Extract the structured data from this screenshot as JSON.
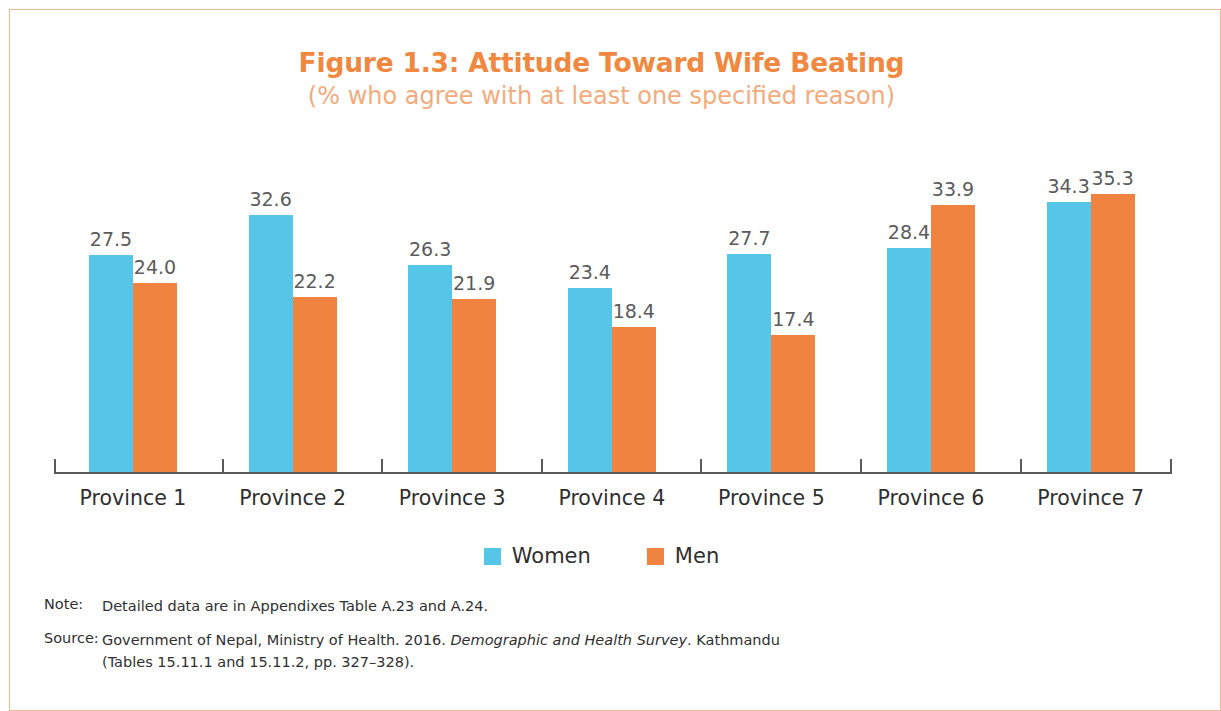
{
  "figure": {
    "title": "Figure 1.3: Attitude Toward Wife Beating",
    "subtitle": "(% who agree with at least one specified reason)"
  },
  "legend": {
    "items": [
      {
        "label": "Women",
        "color": "#55c5e8",
        "swatch": "women-swatch"
      },
      {
        "label": "Men",
        "color": "#f0833f",
        "swatch": "men-swatch"
      }
    ]
  },
  "footnotes": {
    "note_key": "Note:",
    "note_text": "Detailed data are in Appendixes Table A.23 and A.24.",
    "source_key": "Source:",
    "source_text_1": "Government of Nepal, Ministry of Health. 2016. ",
    "source_italic": "Demographic and Health Survey",
    "source_text_2": ". Kathmandu",
    "source_line_2": "(Tables 15.11.1 and 15.11.2, pp. 327–328)."
  },
  "chart_data": {
    "type": "bar",
    "title": "Figure 1.3: Attitude Toward Wife Beating",
    "subtitle": "(% who agree with at least one specified reason)",
    "xlabel": "",
    "ylabel": "% who agree with at least one specified reason",
    "ylim": [
      0,
      40
    ],
    "grid": false,
    "legend_position": "bottom",
    "categories": [
      "Province 1",
      "Province 2",
      "Province 3",
      "Province 4",
      "Province 5",
      "Province 6",
      "Province 7"
    ],
    "series": [
      {
        "name": "Women",
        "color": "#55c5e8",
        "values": [
          27.5,
          32.6,
          26.3,
          23.4,
          27.7,
          28.4,
          34.3
        ],
        "labels": [
          "27.5",
          "32.6",
          "26.3",
          "23.4",
          "27.7",
          "28.4",
          "34.3"
        ]
      },
      {
        "name": "Men",
        "color": "#f0833f",
        "values": [
          24.0,
          22.2,
          21.9,
          18.4,
          17.4,
          33.9,
          35.3
        ],
        "labels": [
          "24.0",
          "22.2",
          "21.9",
          "18.4",
          "17.4",
          "33.9",
          "35.3"
        ]
      }
    ]
  }
}
